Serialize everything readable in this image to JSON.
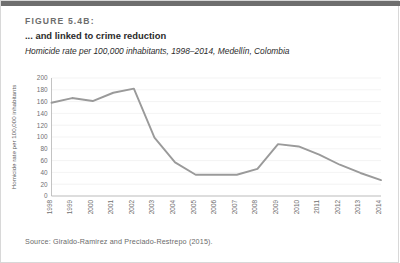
{
  "figure": {
    "number": "FIGURE 5.4B:",
    "title": "... and linked to crime reduction",
    "subtitle": "Homicide rate per 100,000 inhabitants, 1998–2014, Medellín, Colombia",
    "source": "Source: Giraldo-Ramirez and Preciado-Restrepo (2015)."
  },
  "colors": {
    "top_rule": "#6e6e6e",
    "line": "#9a9a9a",
    "grid": "#ebebeb",
    "axis": "#b4b4b4",
    "tick_text": "#6f6f6f",
    "title_text": "#2b2b2b",
    "figure_number_text": "#6d6d6d",
    "source_text": "#6a6a6a"
  },
  "chart_data": {
    "type": "line",
    "title": "... and linked to crime reduction",
    "subtitle": "Homicide rate per 100,000 inhabitants, 1998–2014, Medellín, Colombia",
    "xlabel": "",
    "ylabel": "Homicide rate per 100,000 inhabitants",
    "grid": true,
    "legend": "none",
    "ylim": [
      0,
      200
    ],
    "yticks": [
      0,
      20,
      40,
      60,
      80,
      100,
      120,
      140,
      160,
      180,
      200
    ],
    "ytick_labels": [
      "0",
      "20",
      "40",
      "60",
      "80",
      "100",
      "120",
      "140",
      "160",
      "180",
      "200"
    ],
    "categories": [
      "1998",
      "1999",
      "2000",
      "2001",
      "2002",
      "2003",
      "2004",
      "2005",
      "2006",
      "2007",
      "2008",
      "2009",
      "2010",
      "2011",
      "2012",
      "2013",
      "2014"
    ],
    "x": [
      1998,
      1999,
      2000,
      2001,
      2002,
      2003,
      2004,
      2005,
      2006,
      2007,
      2008,
      2009,
      2010,
      2011,
      2012,
      2013,
      2014
    ],
    "series": [
      {
        "name": "Homicide rate",
        "values": [
          158,
          166,
          161,
          175,
          182,
          99,
          57,
          36,
          36,
          36,
          46,
          88,
          84,
          70,
          53,
          39,
          27
        ]
      }
    ]
  }
}
